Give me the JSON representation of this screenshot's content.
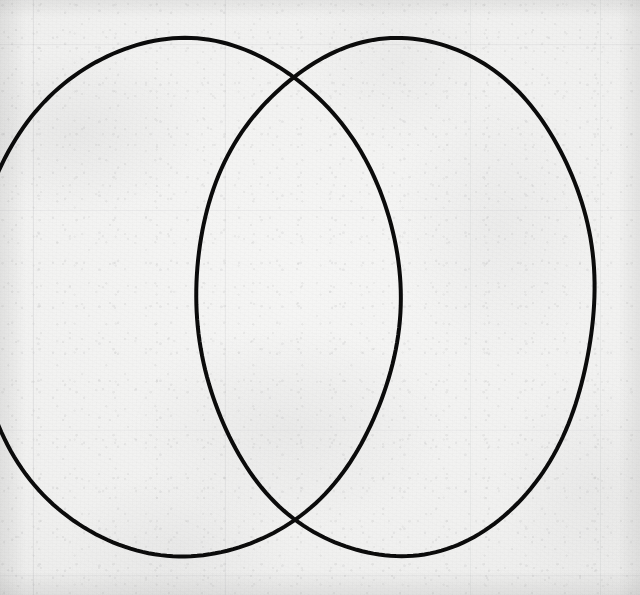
{
  "canvas": {
    "width": 640,
    "height": 595,
    "medium": "ink on aged paper",
    "paper_color": "#f2f2f1",
    "ink_color": "#0b0b0b",
    "background_description": "aged off-white paper with fibrous speckled texture and faint printed grid ruling"
  },
  "drawing": {
    "title": "Two overlapping circles",
    "subject": "vesica piscis / two-set Venn diagram outline",
    "shape_count": 2,
    "stroke_width": 4,
    "shapes": [
      {
        "name": "left-circle",
        "label": "Left circle",
        "type": "ellipse",
        "center_x": 185,
        "center_y": 298,
        "radius_x": 214,
        "radius_y": 259,
        "clipped_at_left_edge": true,
        "top_y": 40,
        "bottom_y": 557
      },
      {
        "name": "right-circle",
        "label": "Right circle",
        "type": "ellipse",
        "center_x": 396,
        "center_y": 297,
        "radius_x": 199,
        "radius_y": 259,
        "clipped_at_left_edge": false,
        "top_y": 38,
        "bottom_y": 556
      }
    ],
    "intersections": [
      {
        "name": "upper-crossing",
        "label": "Upper intersection",
        "x": 288,
        "y": 80
      },
      {
        "name": "lower-crossing",
        "label": "Lower intersection",
        "x": 288,
        "y": 518
      }
    ]
  },
  "ruling": {
    "label": "Faint printed grid lines",
    "vertical_x": [
      33,
      225,
      470,
      600
    ],
    "horizontal_y": [
      44,
      210,
      430,
      575
    ],
    "color": "#787a84"
  }
}
